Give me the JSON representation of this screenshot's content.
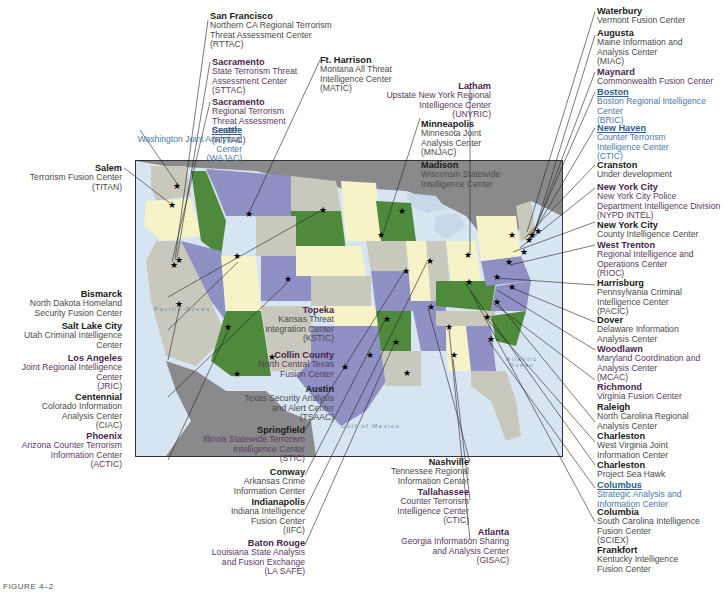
{
  "figure_caption": "FIGURE 4–2",
  "map": {
    "oceans": {
      "pacific": "Pacific\nOcean",
      "atlantic": "Atlantic\nOcean",
      "gulf": "Gulf of Mexico"
    },
    "colors": {
      "water": "#d7e5f2",
      "canada_mexico": "#8a8a8c",
      "state_green": "#4f8a3c",
      "state_purple": "#8f90c4",
      "state_yellow": "#f7f3c8",
      "state_gray": "#c9c8bd",
      "label_purple": "#4a1f4f",
      "label_blue": "#2e5f8f"
    }
  },
  "labels": {
    "san_francisco": {
      "city": "San Francisco",
      "desc": "Northern CA Regional Terrorism\nThreat Assessment Center\n(RTTAC)"
    },
    "sacramento1": {
      "city": "Sacramento",
      "desc": "State Terrorism Threat\nAssessment Center\n(STTAC)"
    },
    "sacramento2": {
      "city": "Sacramento",
      "desc": "Regional Terrorism\nThreat Assessment\nCenter\n(RTTAC)"
    },
    "ft_harrison": {
      "city": "Ft. Harrison",
      "desc": "Montana All Threat\nIntelligence Center\n(MATIC)"
    },
    "seattle": {
      "city": "Seattle",
      "desc": "Washington Joint Analytical\nCenter\n(WAJAC)"
    },
    "salem": {
      "city": "Salem",
      "desc": "Terrorism Fusion Center\n(TITAN)"
    },
    "latham": {
      "city": "Latham",
      "desc": "Upstate New York Regional\nIntelligence Center\n(UNYRIC)"
    },
    "minneapolis": {
      "city": "Minneapolis",
      "desc": "Minnesota Joint\nAnalysis Center\n(MNJAC)"
    },
    "madison": {
      "city": "Madison",
      "desc": "Wisconsin Statewide\nIntelligence Center"
    },
    "waterbury": {
      "city": "Waterbury",
      "desc": "Vermont Fusion Center"
    },
    "augusta": {
      "city": "Augusta",
      "desc": "Maine Information and\nAnalysis Center\n(MIAC)"
    },
    "maynard": {
      "city": "Maynard",
      "desc": "Commonwealth Fusion Center"
    },
    "boston": {
      "city": "Boston",
      "desc": "Boston Regional Intelligence\nCenter\n(BRIC)"
    },
    "new_haven": {
      "city": "New Haven",
      "desc": "Counter Terrorism\nIntelligence Center\n(CTIC)"
    },
    "cranston": {
      "city": "Cranston",
      "desc": "Under development"
    },
    "nyc1": {
      "city": "New York City",
      "desc": "New York City Police\nDepartment Intelligence Division\n(NYPD INTEL)"
    },
    "nyc2": {
      "city": "New York City",
      "desc": "County Intelligence Center"
    },
    "west_trenton": {
      "city": "West Trenton",
      "desc": "Regional Intelligence and\nOperations Center\n(RIOC)"
    },
    "harrisburg": {
      "city": "Harrisburg",
      "desc": "Pennsylvania Criminal\nIntelligence Center\n(PACIC)"
    },
    "dover": {
      "city": "Dover",
      "desc": "Delaware Information\nAnalysis Center"
    },
    "woodlawn": {
      "city": "Woodlawn",
      "desc": "Maryland Coordination and\nAnalysis Center\n(MCAC)"
    },
    "richmond": {
      "city": "Richmond",
      "desc": "Virginia Fusion Center"
    },
    "raleigh": {
      "city": "Raleigh",
      "desc": "North Carolina Regional\nAnalysis Center"
    },
    "charleston_wv": {
      "city": "Charleston",
      "desc": "West Virginia Joint\nInformation Center"
    },
    "charleston_sc": {
      "city": "Charleston",
      "desc": "Project Sea Hawk"
    },
    "columbus": {
      "city": "Columbus",
      "desc": "Strategic Analysis and\nInformation Center"
    },
    "columbia": {
      "city": "Columbia",
      "desc": "South Carolina Intelligence\nFusion Center\n(SCIEX)"
    },
    "frankfort": {
      "city": "Frankfort",
      "desc": "Kentucky Intelligence\nFusion Center"
    },
    "bismarck": {
      "city": "Bismarck",
      "desc": "North Dakota Homeland\nSecurity Fusion Center"
    },
    "salt_lake": {
      "city": "Salt Lake City",
      "desc": "Utah Criminal Intelligence\nCenter"
    },
    "los_angeles": {
      "city": "Los Angeles",
      "desc": "Joint Regional Intelligence\nCenter\n(JRIC)"
    },
    "centennial": {
      "city": "Centennial",
      "desc": "Colorado Information\nAnalysis Center\n(CIAC)"
    },
    "phoenix": {
      "city": "Phoenix",
      "desc": "Arizona Counter Terrorism\nInformation Center\n(ACTIC)"
    },
    "topeka": {
      "city": "Topeka",
      "desc": "Kansas Threat\nIntegration Center\n(KSTIC)"
    },
    "collin": {
      "city": "Collin County",
      "desc": "North Central Texas\nFusion Center"
    },
    "austin": {
      "city": "Austin",
      "desc": "Texas Security Analysis\nand Alert Center\n(TSAAC)"
    },
    "springfield": {
      "city": "Springfield",
      "desc": "Illinois Statewide Terrorism\nIntelligence Center\n(STIC)"
    },
    "conway": {
      "city": "Conway",
      "desc": "Arkansas Crime\nInformation Center"
    },
    "indianapolis": {
      "city": "Indianapolis",
      "desc": "Indiana Intelligence\nFusion Center\n(IIFC)"
    },
    "baton_rouge": {
      "city": "Baton Rouge",
      "desc": "Louisiana State Analysis\nand Fusion Exchange\n(LA SAFE)"
    },
    "nashville": {
      "city": "Nashville",
      "desc": "Tennessee Regional\nInformation Center"
    },
    "tallahassee": {
      "city": "Tallahassee",
      "desc": "Counter Terrorism\nIntelligence Center\n(CTIC)"
    },
    "atlanta": {
      "city": "Atlanta",
      "desc": "Georgia Information Sharing\nand Analysis Center\n(GISAC)"
    }
  }
}
